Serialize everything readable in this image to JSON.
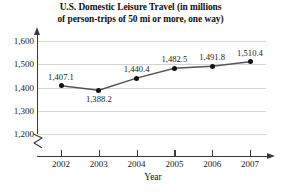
{
  "chart_data": {
    "type": "line",
    "title": "U.S. Domestic Leisure Travel (in millions of person-trips of 50 mi or more, one way)",
    "title_lines": [
      "U.S. Domestic Leisure Travel (in millions",
      "of person-trips of 50 mi or more, one way)"
    ],
    "xlabel": "Year",
    "ylabel": "",
    "categories": [
      "2002",
      "2003",
      "2004",
      "2005",
      "2006",
      "2007"
    ],
    "values": [
      1407.1,
      1388.2,
      1440.4,
      1482.5,
      1491.8,
      1510.4
    ],
    "point_labels": [
      "1,407.1",
      "1,388.2",
      "1,440.4",
      "1,482.5",
      "1,491.8",
      "1,510.4"
    ],
    "label_positions": [
      "above",
      "below",
      "above",
      "above",
      "above",
      "above"
    ],
    "ylim": [
      1200,
      1600
    ],
    "y_ticks": [
      1200,
      1300,
      1400,
      1500,
      1600
    ],
    "y_tick_labels": [
      "1,200",
      "1,300",
      "1,400",
      "1,500",
      "1,600"
    ],
    "grid": true,
    "grid_axis": "y",
    "legend": "none",
    "axis_break": true,
    "axis_break_note": "y-axis broken below 1,200",
    "series_name": "Person-trips",
    "colors": {
      "line": "#555555",
      "marker": "#111111",
      "gridline": "#d4d4d4",
      "axis": "#3a3a3a",
      "text": "#1a1a1a",
      "background": "#ffffff"
    }
  }
}
